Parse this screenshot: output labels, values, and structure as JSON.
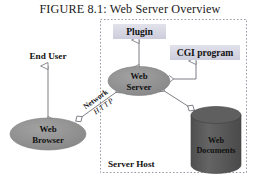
{
  "figure": {
    "title": "FIGURE 8.1: Web Server Overview",
    "caption_number": "8.1"
  },
  "boundary": {
    "label": "Server Host",
    "style": "dashed",
    "color": "#9a9aa6"
  },
  "nodes": {
    "end_user": {
      "label": "End User",
      "type": "text-label"
    },
    "web_browser": {
      "label_line1": "Web",
      "label_line2": "Browser",
      "type": "ellipse",
      "fill": "#8f8f8f"
    },
    "web_server": {
      "label_line1": "Web",
      "label_line2": "Server",
      "type": "ellipse",
      "fill": "#8f8f8f"
    },
    "plugin": {
      "label": "Plugin",
      "type": "box",
      "fill": "#d8d8e4"
    },
    "cgi_program": {
      "label": "CGI program",
      "type": "box",
      "fill": "#d8d8e4"
    },
    "web_documents": {
      "label_line1": "Web",
      "label_line2": "Documents",
      "type": "cylinder",
      "fill": "#5a5a5a",
      "text_color": "#ffffff"
    }
  },
  "connectors": {
    "network": {
      "label_top": "Network",
      "label_bottom": "HTTP",
      "from": "web_browser",
      "to": "web_server",
      "arrow": "double-hollow"
    },
    "user_browser": {
      "from": "end_user",
      "to": "web_browser",
      "arrow": "double-hollow"
    },
    "server_plugin": {
      "from": "web_server",
      "to": "plugin",
      "arrow": "double-hollow"
    },
    "server_cgi": {
      "from": "web_server",
      "to": "cgi_program",
      "arrow": "double-hollow"
    },
    "server_docs": {
      "from": "web_server",
      "to": "web_documents",
      "arrow": "double-hollow"
    }
  }
}
